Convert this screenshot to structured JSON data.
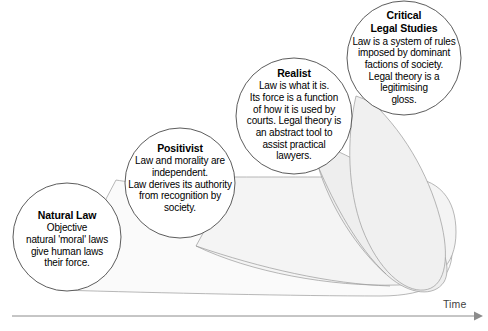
{
  "diagram": {
    "type": "concept-timeline-diagram",
    "background_color": "#ffffff",
    "circle_stroke_color": "#4a4a4a",
    "band_fill_color": "#f2f2f2",
    "band_stroke_color": "#8c8c8c",
    "axis_color": "#8c8c8c",
    "text_color": "#000000"
  },
  "nodes": [
    {
      "id": "natural-law",
      "title": "Natural Law",
      "body": "Objective natural 'moral' laws give human laws their force.",
      "lines": [
        "Objective",
        "natural 'moral' laws",
        "give human laws",
        "their force."
      ],
      "cx": 67,
      "cy": 237,
      "r": 54
    },
    {
      "id": "positivist",
      "title": "Positivist",
      "body": "Law and morality are independent. Law derives its authority from recognition by society.",
      "lines": [
        "Law and morality are",
        "independent.",
        "Law derives its authority",
        "from recognition by",
        "society."
      ],
      "cx": 180,
      "cy": 183,
      "r": 55
    },
    {
      "id": "realist",
      "title": "Realist",
      "body": "Law is what it is. Its force is a function of how it is used by courts. Legal theory is an abstract tool to assist practical lawyers.",
      "lines": [
        "Law is what it is.",
        "Its force is a function",
        "of how it is used by",
        "courts. Legal theory is",
        "an abstract tool to",
        "assist practical",
        "lawyers."
      ],
      "cx": 294,
      "cy": 116,
      "r": 58
    },
    {
      "id": "critical-legal-studies",
      "title": "Critical Legal Studies",
      "title_lines": [
        "Critical",
        "Legal Studies"
      ],
      "body": "Law is a system of rules imposed by dominant factions of society. Legal theory is a legitimising gloss.",
      "lines": [
        "Law is a system of rules",
        "imposed by dominant",
        "factions of society.",
        "Legal theory is a",
        "legitimising",
        "gloss."
      ],
      "cx": 404,
      "cy": 58,
      "r": 57
    }
  ],
  "axis": {
    "label": "Time",
    "direction": "left-to-right",
    "arrow": "right-arrow-icon"
  }
}
